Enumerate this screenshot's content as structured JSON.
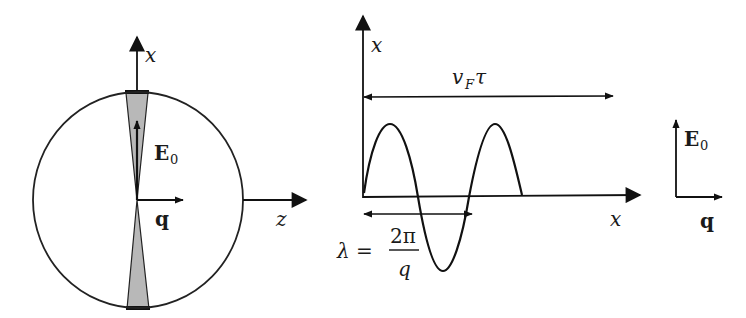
{
  "diagram": {
    "left_panel": {
      "axis_vertical_label": "x",
      "axis_horizontal_label": "z",
      "field_vector_label": "E",
      "field_vector_subscript": "0",
      "wavevector_label": "q",
      "shape": "circle with shaded double-cone along x-axis"
    },
    "middle_panel": {
      "axis_vertical_label": "x",
      "axis_horizontal_label": "x",
      "span_label_main": "v",
      "span_label_sub": "F",
      "span_label_tail": "τ",
      "wavelength_lhs": "λ =",
      "wavelength_numerator": "2π",
      "wavelength_denominator": "q",
      "curve": "sine wave of ~1.5 periods, decaying end"
    },
    "right_panel": {
      "vertical_label": "E",
      "vertical_subscript": "0",
      "horizontal_label": "q"
    },
    "colors": {
      "stroke": "#111111",
      "cone_fill": "#b8b8b8",
      "background": "#ffffff"
    }
  }
}
